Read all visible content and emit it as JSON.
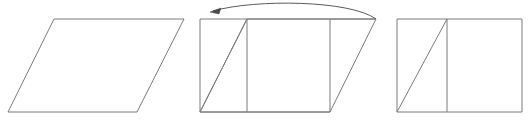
{
  "figure": {
    "title": "Parallelogram cut-and-rearrange into a rectangle",
    "description": "Three panels: a parallelogram, the same parallelogram with the left triangle marked and an arrow showing it translated to the right, and the resulting rectangle.",
    "background_color": "#ffffff",
    "stroke_color": "#7b7b7b",
    "arrow_color": "#4a4a4a",
    "canvas": {
      "width": 530,
      "height": 124
    }
  },
  "chart_data": {
    "type": "diagram",
    "title": "Parallelogram cut-and-rearrange into a rectangle",
    "panels": [
      {
        "id": "panel-1",
        "name": "parallelogram",
        "label": "",
        "shape": "parallelogram",
        "vertices": [
          [
            8,
            112
          ],
          [
            54,
            19
          ],
          [
            184,
            19
          ],
          [
            137,
            112
          ]
        ],
        "interior_lines": []
      },
      {
        "id": "panel-2",
        "name": "parallelogram-with-cut",
        "label": "",
        "shape": "parallelogram",
        "vertices": [
          [
            200,
            112
          ],
          [
            247,
            19
          ],
          [
            376,
            19
          ],
          [
            330,
            112
          ]
        ],
        "interior_lines": [
          {
            "name": "cut-diagonal",
            "from": [
              200,
              112
            ],
            "to": [
              247,
              19
            ]
          },
          {
            "name": "left-vertical",
            "from": [
              200,
              19
            ],
            "to": [
              200,
              112
            ]
          },
          {
            "name": "cut-vertical",
            "from": [
              247,
              19
            ],
            "to": [
              247,
              112
            ]
          },
          {
            "name": "right-vertical",
            "from": [
              330,
              19
            ],
            "to": [
              330,
              112
            ]
          },
          {
            "name": "top-extension",
            "from": [
              200,
              19
            ],
            "to": [
              247,
              19
            ]
          },
          {
            "name": "bottom-extension",
            "from": [
              200,
              112
            ],
            "to": [
              330,
              112
            ]
          }
        ],
        "annotation": {
          "name": "translation-arrow",
          "type": "curved-arrow",
          "direction": "right-to-left",
          "from": [
            376,
            19
          ],
          "to": [
            211,
            11
          ],
          "apex": [
            293,
            3
          ]
        }
      },
      {
        "id": "panel-3",
        "name": "rectangle-result",
        "label": "",
        "shape": "rectangle",
        "vertices": [
          [
            397,
            19
          ],
          [
            522,
            19
          ],
          [
            522,
            112
          ],
          [
            397,
            112
          ]
        ],
        "interior_lines": [
          {
            "name": "cut-diagonal",
            "from": [
              397,
              112
            ],
            "to": [
              447,
              19
            ]
          },
          {
            "name": "cut-vertical",
            "from": [
              447,
              19
            ],
            "to": [
              447,
              112
            ]
          }
        ]
      }
    ],
    "axis": {
      "grid": false,
      "legend": false
    },
    "xlabel": "",
    "ylabel": ""
  },
  "labels": {
    "panel_1_caption": "",
    "panel_2_caption": "",
    "panel_3_caption": ""
  }
}
